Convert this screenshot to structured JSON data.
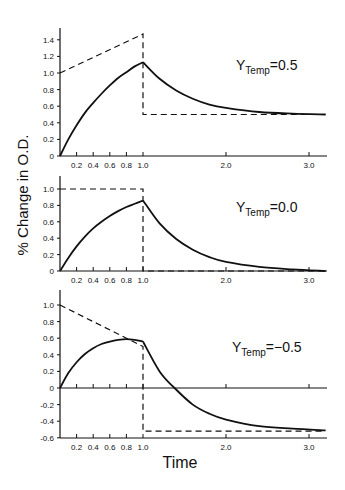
{
  "chart_data": [
    {
      "type": "line",
      "panel": 1,
      "annotation": {
        "symbol": "Y",
        "subscript": "Temp",
        "value": "=0.5"
      },
      "xlabel": "",
      "ylabel": "% Change in O.D.",
      "xlim": [
        0,
        3.2
      ],
      "ylim": [
        0,
        1.5
      ],
      "x_ticks": [
        "0.2",
        "0.4",
        "0.6",
        "0.8",
        "1.0",
        "2.0",
        "3.0"
      ],
      "y_ticks": [
        "0",
        "0.2",
        "0.4",
        "0.6",
        "0.8",
        "1.0",
        "1.2",
        "1.4"
      ],
      "series": [
        {
          "name": "response (solid)",
          "style": "solid",
          "x": [
            0,
            0.1,
            0.2,
            0.3,
            0.4,
            0.5,
            0.6,
            0.7,
            0.8,
            0.9,
            1.0,
            1.2,
            1.4,
            1.6,
            1.8,
            2.0,
            2.4,
            2.8,
            3.2
          ],
          "y": [
            0,
            0.2,
            0.37,
            0.52,
            0.64,
            0.75,
            0.85,
            0.94,
            1.01,
            1.08,
            1.13,
            0.93,
            0.79,
            0.69,
            0.62,
            0.58,
            0.53,
            0.51,
            0.5
          ]
        },
        {
          "name": "input (dashed)",
          "style": "dashed",
          "x": [
            0,
            1.0,
            1.0,
            3.2
          ],
          "y": [
            1.0,
            1.47,
            0.5,
            0.5
          ]
        }
      ]
    },
    {
      "type": "line",
      "panel": 2,
      "annotation": {
        "symbol": "Y",
        "subscript": "Temp",
        "value": "=0.0"
      },
      "xlabel": "",
      "ylabel": "% Change in O.D.",
      "xlim": [
        0,
        3.2
      ],
      "ylim": [
        0,
        1.15
      ],
      "x_ticks": [
        "0.2",
        "0.4",
        "0.6",
        "0.8",
        "1.0",
        "2.0",
        "3.0"
      ],
      "y_ticks": [
        "0",
        "0.2",
        "0.4",
        "0.6",
        "0.8",
        "1.0"
      ],
      "series": [
        {
          "name": "response (solid)",
          "style": "solid",
          "x": [
            0,
            0.1,
            0.2,
            0.3,
            0.4,
            0.5,
            0.6,
            0.7,
            0.8,
            0.9,
            1.0,
            1.2,
            1.4,
            1.6,
            1.8,
            2.0,
            2.4,
            2.8,
            3.2
          ],
          "y": [
            0,
            0.16,
            0.3,
            0.42,
            0.52,
            0.6,
            0.67,
            0.73,
            0.78,
            0.82,
            0.86,
            0.58,
            0.39,
            0.26,
            0.17,
            0.11,
            0.05,
            0.02,
            0.0
          ]
        },
        {
          "name": "input (dashed)",
          "style": "dashed",
          "x": [
            0,
            1.0,
            1.0,
            3.2
          ],
          "y": [
            1.0,
            1.0,
            0.0,
            0.0
          ]
        }
      ]
    },
    {
      "type": "line",
      "panel": 3,
      "annotation": {
        "symbol": "Y",
        "subscript": "Temp",
        "value": "=-0.5"
      },
      "xlabel": "Time",
      "ylabel": "% Change in O.D.",
      "xlim": [
        0,
        3.2
      ],
      "ylim": [
        -0.6,
        1.15
      ],
      "x_ticks": [
        "0.2",
        "0.4",
        "0.6",
        "0.8",
        "1.0",
        "2.0",
        "3.0"
      ],
      "y_ticks": [
        "-0.6",
        "-0.4",
        "-0.2",
        "0",
        "0.2",
        "0.4",
        "0.6",
        "0.8",
        "1.0"
      ],
      "series": [
        {
          "name": "response (solid)",
          "style": "solid",
          "x": [
            0,
            0.1,
            0.2,
            0.3,
            0.4,
            0.5,
            0.6,
            0.7,
            0.8,
            0.9,
            1.0,
            1.2,
            1.38,
            1.6,
            1.8,
            2.0,
            2.4,
            2.8,
            3.2
          ],
          "y": [
            0,
            0.18,
            0.31,
            0.41,
            0.48,
            0.53,
            0.56,
            0.58,
            0.59,
            0.58,
            0.56,
            0.2,
            0.0,
            -0.2,
            -0.31,
            -0.38,
            -0.46,
            -0.49,
            -0.51
          ]
        },
        {
          "name": "input (dashed)",
          "style": "dashed",
          "x": [
            0,
            1.0,
            1.0,
            3.2
          ],
          "y": [
            1.0,
            0.5,
            -0.52,
            -0.52
          ]
        }
      ]
    }
  ],
  "labels": {
    "ylabel": "% Change in O.D.",
    "xlabel": "Time",
    "panel1": {
      "sym": "Y",
      "sub": "Temp",
      "val": "=0.5"
    },
    "panel2": {
      "sym": "Y",
      "sub": "Temp",
      "val": "=0.0"
    },
    "panel3": {
      "sym": "Y",
      "sub": "Temp",
      "val": "=−0.5"
    }
  }
}
